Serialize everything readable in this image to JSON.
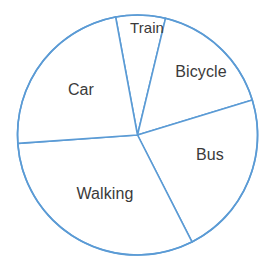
{
  "chart_data": {
    "type": "pie",
    "title": "",
    "subtitle": "",
    "xlabel": "",
    "ylabel": "",
    "grid": false,
    "legend": "none",
    "labels_position": "inside-slices",
    "categories": [
      "Train",
      "Bicycle",
      "Bus",
      "Walking",
      "Car"
    ],
    "values": [
      24,
      60,
      80,
      113,
      84
    ],
    "units": "degrees",
    "percentages": [
      6.7,
      16.7,
      22.2,
      31.4,
      23.3
    ],
    "start_angle_deg": -10.5,
    "direction": "clockwise",
    "slices": [
      {
        "label": "Train",
        "angle_deg": 24,
        "percent": 6.7,
        "start_deg": -10.5,
        "end_deg": 13.5,
        "label_x": 147,
        "label_y": 27,
        "font_size": 15
      },
      {
        "label": "Bicycle",
        "angle_deg": 60,
        "percent": 16.7,
        "start_deg": 13.5,
        "end_deg": 73.0,
        "label_x": 201,
        "label_y": 72,
        "font_size": 16
      },
      {
        "label": "Bus",
        "angle_deg": 80,
        "percent": 22.2,
        "start_deg": 73.0,
        "end_deg": 153.0,
        "label_x": 210,
        "label_y": 155,
        "font_size": 16
      },
      {
        "label": "Walking",
        "angle_deg": 113,
        "percent": 31.4,
        "start_deg": 153.0,
        "end_deg": 266.0,
        "label_x": 105,
        "label_y": 194,
        "font_size": 16
      },
      {
        "label": "Car",
        "angle_deg": 84,
        "percent": 23.3,
        "start_deg": 266.0,
        "end_deg": 349.5,
        "label_x": 81,
        "label_y": 90,
        "font_size": 16
      }
    ],
    "geometry": {
      "center_x": 137.5,
      "center_y": 135,
      "radius": 120,
      "stroke_width": 1.6
    },
    "colors": {
      "stroke": "#5B9BD5",
      "slice_fill": "#FFFFFF",
      "label_text": "#3A3A3A",
      "background": "#FFFFFF"
    }
  }
}
